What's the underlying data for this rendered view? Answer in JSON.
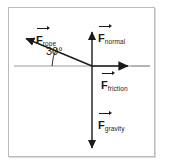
{
  "diagram": {
    "origin": {
      "x": 92,
      "y": 66
    },
    "frame": {
      "x": 8,
      "y": 7,
      "width": 147,
      "height": 150,
      "border_color": "#b9bcbd",
      "background": "#ffffff"
    },
    "axis_color": "#9a9a9a",
    "vector_color": "#1a1a1a",
    "axes": {
      "horizontal": {
        "name": "horizontal-axis",
        "x1": 14,
        "y1": 66,
        "x2": 150,
        "y2": 66
      },
      "vertical": {
        "name": "vertical-axis",
        "x1": 92,
        "y1": 30,
        "x2": 92,
        "y2": 150
      }
    },
    "angle": {
      "label": "30°",
      "value": 30,
      "unit": "degrees",
      "between": [
        "F_rope",
        "negative-x-axis"
      ]
    },
    "vectors": [
      {
        "id": "rope",
        "symbol": "F",
        "subscript": "rope",
        "label": "F rope",
        "direction": "up-left",
        "angle_deg": 30,
        "tail": {
          "x": 92,
          "y": 66
        },
        "tip": {
          "x": 22,
          "y": 37
        }
      },
      {
        "id": "normal",
        "symbol": "F",
        "subscript": "normal",
        "label": "F normal",
        "direction": "up",
        "angle_deg": 90,
        "tail": {
          "x": 92,
          "y": 66
        },
        "tip": {
          "x": 92,
          "y": 30
        }
      },
      {
        "id": "friction",
        "symbol": "F",
        "subscript": "friction",
        "label": "F friction",
        "direction": "right",
        "angle_deg": 0,
        "tail": {
          "x": 92,
          "y": 66
        },
        "tip": {
          "x": 131,
          "y": 66
        }
      },
      {
        "id": "gravity",
        "symbol": "F",
        "subscript": "gravity",
        "label": "F gravity",
        "direction": "down",
        "angle_deg": 270,
        "tail": {
          "x": 92,
          "y": 66
        },
        "tip": {
          "x": 92,
          "y": 150
        }
      }
    ]
  }
}
